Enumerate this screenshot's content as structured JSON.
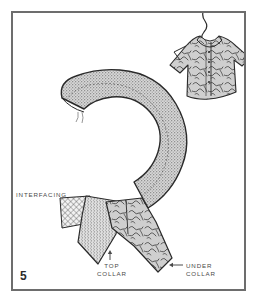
{
  "figure": {
    "number": "5",
    "type": "sewing-instruction-illustration",
    "caption_labels": {
      "interfacing": "INTERFACING",
      "top_collar": "TOP\nCOLLAR",
      "under_collar": "UNDER\nCOLLAR"
    }
  },
  "colors": {
    "frame": "#6d6d6d",
    "background": "#ffffff",
    "stipple_fill": "#b0b0b0",
    "outline": "#2a2a2a",
    "label_text": "#4a4a4a",
    "number_text": "#2b2b2b",
    "print_fabric": "#c9c9c9",
    "interfacing_mesh": "#555555"
  },
  "elements": {
    "collar_piece": "collar-crescent",
    "shirt": "patterned-shirt-on-hanger",
    "hanger": "hanger-hook",
    "interfacing_swatch": "crosshatch-interfacing",
    "top_collar_piece": "top-collar-fabric",
    "under_collar_piece": "under-collar-fabric",
    "arrow_up": "arrow-up",
    "arrow_left": "arrow-left"
  }
}
